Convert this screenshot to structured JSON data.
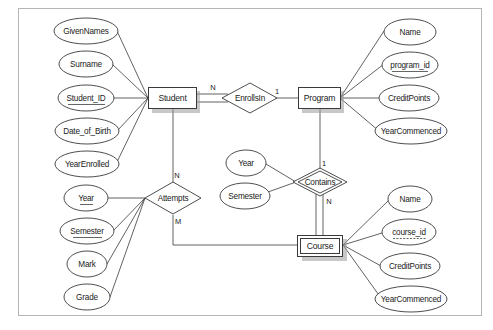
{
  "diagram": {
    "type": "er-diagram",
    "entities": [
      {
        "id": "student",
        "label": "Student",
        "weak": false
      },
      {
        "id": "program",
        "label": "Program",
        "weak": false
      },
      {
        "id": "course",
        "label": "Course",
        "weak": true
      }
    ],
    "relationships": [
      {
        "id": "enrollsin",
        "label": "EnrollsIn",
        "identifying": false
      },
      {
        "id": "attempts",
        "label": "Attempts",
        "identifying": false
      },
      {
        "id": "contains",
        "label": "Contains",
        "identifying": true
      }
    ],
    "attributes": {
      "student": [
        {
          "label": "GivenNames",
          "key": "none"
        },
        {
          "label": "Surname",
          "key": "none"
        },
        {
          "label": "Student_ID",
          "key": "primary"
        },
        {
          "label": "Date_of_Birth",
          "key": "none"
        },
        {
          "label": "YearEnrolled",
          "key": "none"
        }
      ],
      "program": [
        {
          "label": "Name",
          "key": "none"
        },
        {
          "label": "program_id",
          "key": "primary"
        },
        {
          "label": "CreditPoints",
          "key": "none"
        },
        {
          "label": "YearCommenced",
          "key": "none"
        }
      ],
      "course": [
        {
          "label": "Name",
          "key": "none"
        },
        {
          "label": "course_id",
          "key": "partial"
        },
        {
          "label": "CreditPoints",
          "key": "none"
        },
        {
          "label": "YearCommenced",
          "key": "none"
        }
      ],
      "attempts": [
        {
          "label": "Year",
          "key": "primary"
        },
        {
          "label": "Semester",
          "key": "primary"
        },
        {
          "label": "Mark",
          "key": "none"
        },
        {
          "label": "Grade",
          "key": "none"
        }
      ],
      "contains": [
        {
          "label": "Year",
          "key": "none"
        },
        {
          "label": "Semester",
          "key": "none"
        }
      ]
    },
    "cardinalities": {
      "student_enrollsin": "N",
      "enrollsin_program": "1",
      "student_attempts": "N",
      "attempts_course": "M",
      "program_contains": "1",
      "contains_course": "N"
    }
  }
}
